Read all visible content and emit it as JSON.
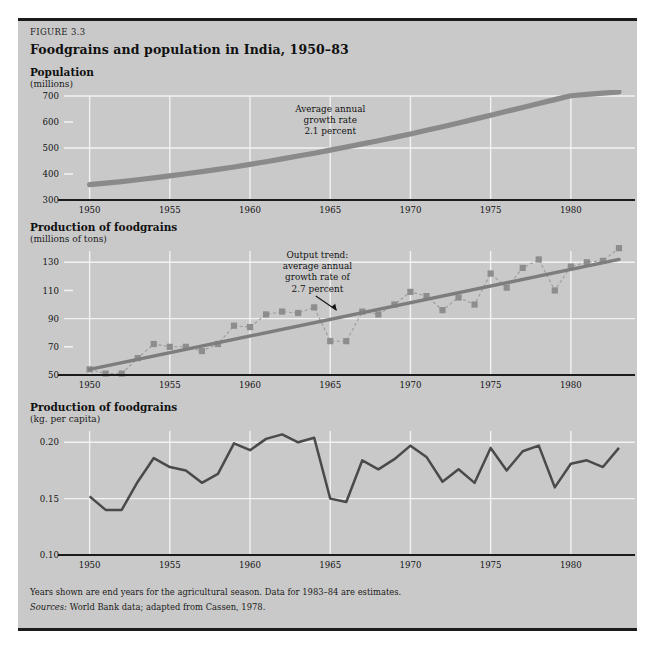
{
  "figure": {
    "number_label": "FIGURE 3.3",
    "title": "Foodgrains and population in India, 1950–83",
    "panel_color": "#c9c9c9",
    "rule_color": "#1b1b1b",
    "grid_color": "#f2f2f2",
    "series_color": "#8a8a8a",
    "line_color": "#4a4a4a",
    "axis_color": "#1b1b1b"
  },
  "footnotes": {
    "note": "Years shown are end years for the agricultural season. Data for 1983–84 are estimates.",
    "source_label": "Sources:",
    "source_text": "World Bank data; adapted from Cassen, 1978."
  },
  "chart_data": [
    {
      "id": "population",
      "type": "line",
      "title": "Population",
      "subtitle": "(millions)",
      "xlabel": "",
      "ylabel": "millions",
      "xlim": [
        1949.4,
        1984.0
      ],
      "ylim": [
        300,
        700
      ],
      "yticks": [
        300,
        400,
        500,
        600,
        700
      ],
      "ytick_labels": [
        "300",
        "400",
        "500",
        "600",
        "700"
      ],
      "gridline_y": [
        500,
        700
      ],
      "tickmark_y": [
        400,
        600
      ],
      "xticks": [
        1950,
        1955,
        1960,
        1965,
        1970,
        1975,
        1980
      ],
      "xtick_labels": [
        "1950",
        "1955",
        "1960",
        "1965",
        "1970",
        "1975",
        "1980"
      ],
      "gridline_x": [
        1950,
        1955,
        1960,
        1965,
        1970,
        1975,
        1980
      ],
      "grid": true,
      "legend": "none",
      "annotation": {
        "lines": [
          "Average annual",
          "growth rate",
          "2.1 percent"
        ],
        "x": 1965.0,
        "y": 640
      },
      "series": [
        {
          "name": "Population",
          "x": [
            1950,
            1951,
            1952,
            1953,
            1954,
            1955,
            1956,
            1957,
            1958,
            1959,
            1960,
            1961,
            1962,
            1963,
            1964,
            1965,
            1966,
            1967,
            1968,
            1969,
            1970,
            1971,
            1972,
            1973,
            1974,
            1975,
            1976,
            1977,
            1978,
            1979,
            1980,
            1981,
            1982,
            1983
          ],
          "values": [
            359,
            365,
            371,
            378,
            385,
            393,
            401,
            409,
            418,
            427,
            437,
            447,
            458,
            469,
            480,
            492,
            504,
            516,
            528,
            541,
            554,
            568,
            582,
            596,
            611,
            626,
            641,
            656,
            671,
            686,
            701,
            706,
            711,
            716
          ]
        }
      ]
    },
    {
      "id": "output",
      "type": "line",
      "title": "Production of foodgrains",
      "subtitle": "(millions of tons)",
      "xlabel": "",
      "ylabel": "millions of tons",
      "xlim": [
        1949.4,
        1984.0
      ],
      "ylim": [
        50,
        138
      ],
      "yticks": [
        50,
        70,
        90,
        110,
        130
      ],
      "ytick_labels": [
        "50",
        "70",
        "90",
        "110",
        "130"
      ],
      "gridline_y": [
        90,
        130
      ],
      "tickmark_y": [
        70,
        110
      ],
      "xticks": [
        1950,
        1955,
        1960,
        1965,
        1970,
        1975,
        1980
      ],
      "xtick_labels": [
        "1950",
        "1955",
        "1960",
        "1965",
        "1970",
        "1975",
        "1980"
      ],
      "gridline_x": [
        1950,
        1955,
        1960,
        1965,
        1970,
        1975,
        1980
      ],
      "grid": true,
      "legend": "none",
      "annotation": {
        "lines": [
          "Output trend:",
          "average annual",
          "growth rate of",
          "2.7 percent"
        ],
        "x": 1964.2,
        "y": 133,
        "arrow_from": [
          1964.1,
          106
        ],
        "arrow_to": [
          1965.4,
          96
        ]
      },
      "series": [
        {
          "name": "Actual production",
          "markers": true,
          "x": [
            1950,
            1951,
            1952,
            1953,
            1954,
            1955,
            1956,
            1957,
            1958,
            1959,
            1960,
            1961,
            1962,
            1963,
            1964,
            1965,
            1966,
            1967,
            1968,
            1969,
            1970,
            1971,
            1972,
            1973,
            1974,
            1975,
            1976,
            1977,
            1978,
            1979,
            1980,
            1981,
            1982,
            1983
          ],
          "values": [
            54,
            51,
            51,
            62,
            72,
            70,
            70,
            67,
            72,
            85,
            84,
            93,
            95,
            94,
            98,
            74,
            74,
            95,
            93,
            100,
            109,
            106,
            96,
            105,
            100,
            122,
            112,
            126,
            132,
            110,
            127,
            130,
            131,
            140
          ]
        },
        {
          "name": "Output trend",
          "trend": true,
          "x": [
            1950,
            1983
          ],
          "values": [
            54,
            132
          ]
        }
      ]
    },
    {
      "id": "percapita",
      "type": "line",
      "title": "Production of foodgrains",
      "subtitle": "(kg. per capita)",
      "xlabel": "",
      "ylabel": "kg. per capita",
      "xlim": [
        1949.4,
        1984.0
      ],
      "ylim": [
        0.1,
        0.21
      ],
      "yticks": [
        0.1,
        0.15,
        0.2
      ],
      "ytick_labels": [
        "0.10",
        "0.15",
        "0.20"
      ],
      "gridline_y": [
        0.15,
        0.2
      ],
      "tickmark_y": [],
      "xticks": [
        1950,
        1955,
        1960,
        1965,
        1970,
        1975,
        1980
      ],
      "xtick_labels": [
        "1950",
        "1955",
        "1960",
        "1965",
        "1970",
        "1975",
        "1980"
      ],
      "gridline_x": [
        1950,
        1955,
        1960,
        1965,
        1970,
        1975,
        1980
      ],
      "grid": true,
      "legend": "none",
      "annotation": null,
      "series": [
        {
          "name": "Foodgrains per capita",
          "x": [
            1950,
            1951,
            1952,
            1953,
            1954,
            1955,
            1956,
            1957,
            1958,
            1959,
            1960,
            1961,
            1962,
            1963,
            1964,
            1965,
            1966,
            1967,
            1968,
            1969,
            1970,
            1971,
            1972,
            1973,
            1974,
            1975,
            1976,
            1977,
            1978,
            1979,
            1980,
            1981,
            1982,
            1983
          ],
          "values": [
            0.152,
            0.14,
            0.14,
            0.165,
            0.186,
            0.178,
            0.175,
            0.164,
            0.172,
            0.199,
            0.193,
            0.203,
            0.207,
            0.2,
            0.204,
            0.15,
            0.147,
            0.184,
            0.176,
            0.185,
            0.197,
            0.187,
            0.165,
            0.176,
            0.164,
            0.195,
            0.175,
            0.192,
            0.197,
            0.16,
            0.181,
            0.184,
            0.178,
            0.195
          ]
        }
      ]
    }
  ]
}
